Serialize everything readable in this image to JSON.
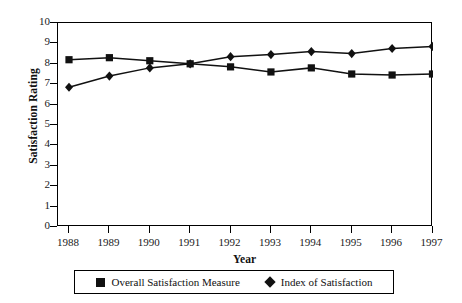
{
  "chart_data": {
    "type": "line",
    "title": "",
    "xlabel": "Year",
    "ylabel": "Satisfaction Rating",
    "categories": [
      "1988",
      "1989",
      "1990",
      "1991",
      "1992",
      "1993",
      "1994",
      "1995",
      "1996",
      "1997"
    ],
    "x": [
      1988,
      1989,
      1990,
      1991,
      1992,
      1993,
      1994,
      1995,
      1996,
      1997
    ],
    "ylim": [
      0,
      10
    ],
    "yticks": [
      0,
      1,
      2,
      3,
      4,
      5,
      6,
      7,
      8,
      9,
      10
    ],
    "ytick_labels": [
      "0",
      "1",
      "2",
      "3",
      "4",
      "5",
      "6",
      "7",
      "8",
      "9",
      "10"
    ],
    "grid": false,
    "legend_position": "bottom",
    "series": [
      {
        "name": "Overall Satisfaction Measure",
        "marker": "square",
        "color": "#111111",
        "values": [
          8.2,
          8.3,
          8.15,
          8.0,
          7.85,
          7.6,
          7.8,
          7.5,
          7.45,
          7.5
        ]
      },
      {
        "name": "Index of Satisfaction",
        "marker": "diamond",
        "color": "#111111",
        "values": [
          6.85,
          7.4,
          7.8,
          8.0,
          8.35,
          8.45,
          8.6,
          8.5,
          8.75,
          8.85
        ]
      }
    ]
  },
  "legend": {
    "entries": [
      {
        "label": "Overall Satisfaction Measure",
        "marker": "square-marker-icon"
      },
      {
        "label": "Index of Satisfaction",
        "marker": "diamond-marker-icon"
      }
    ]
  }
}
